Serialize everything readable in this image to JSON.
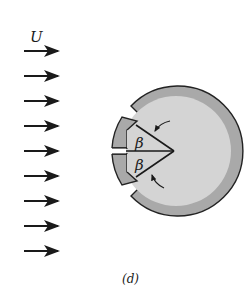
{
  "figure": {
    "flow_label": "U",
    "angle_label_upper": "β",
    "angle_label_lower": "β",
    "caption": "(d)",
    "arrow_count": 9,
    "colors": {
      "outer_ring": "#a9a9a9",
      "inner_disk": "#d4d4d4",
      "stroke": "#222222"
    }
  }
}
